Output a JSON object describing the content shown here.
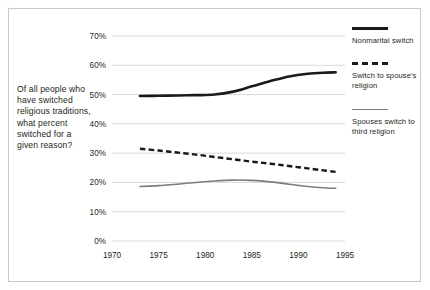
{
  "artifact": {
    "top_text": "·                    ·"
  },
  "caption": {
    "text": "Of all people who have switched religious traditions, what percent switched for a given reason?"
  },
  "legend": {
    "position": "right",
    "entries": [
      {
        "label": "Nonmarital switch",
        "swatch": "solid-black-thick",
        "color": "#1a1a1a"
      },
      {
        "label": "Switch to spouse's religion",
        "swatch": "dashed-black",
        "color": "#1a1a1a"
      },
      {
        "label": "Spouses switch to third religion",
        "swatch": "solid-gray-thin",
        "color": "#7d7d7d"
      }
    ]
  },
  "axes": {
    "y_ticks": [
      "0%",
      "10%",
      "20%",
      "30%",
      "40%",
      "50%",
      "60%",
      "70%"
    ],
    "x_ticks": [
      "1970",
      "1975",
      "1980",
      "1985",
      "1990",
      "1995"
    ],
    "grid_color": "#d9d9d9"
  },
  "chart_data": {
    "type": "line",
    "title": "",
    "subtitle": "",
    "xlabel": "",
    "ylabel": "",
    "xlim": [
      1970,
      1995
    ],
    "ylim": [
      0,
      70
    ],
    "y_tick_values": [
      0,
      10,
      20,
      30,
      40,
      50,
      60,
      70
    ],
    "x_tick_values": [
      1970,
      1975,
      1980,
      1985,
      1990,
      1995
    ],
    "grid": "horizontal",
    "legend_position": "right",
    "y_unit": "percent",
    "x": [
      1973,
      1975,
      1977,
      1979,
      1981,
      1983,
      1985,
      1987,
      1989,
      1991,
      1993,
      1994
    ],
    "series": [
      {
        "name": "Nonmarital switch",
        "color": "#1a1a1a",
        "style": "solid",
        "width": 2.6,
        "values": [
          49.5,
          49.6,
          49.7,
          49.8,
          50.0,
          51.0,
          52.8,
          54.6,
          56.2,
          57.1,
          57.5,
          57.6
        ]
      },
      {
        "name": "Switch to spouse's religion",
        "color": "#1a1a1a",
        "style": "dashed",
        "width": 2.4,
        "values": [
          31.5,
          30.9,
          30.2,
          29.5,
          28.7,
          27.9,
          27.1,
          26.4,
          25.6,
          24.8,
          24.0,
          23.6
        ]
      },
      {
        "name": "Spouses switch to third religion",
        "color": "#7d7d7d",
        "style": "solid",
        "width": 1.6,
        "values": [
          18.6,
          18.9,
          19.4,
          20.0,
          20.5,
          20.8,
          20.7,
          20.2,
          19.4,
          18.6,
          18.1,
          18.0
        ]
      }
    ]
  }
}
